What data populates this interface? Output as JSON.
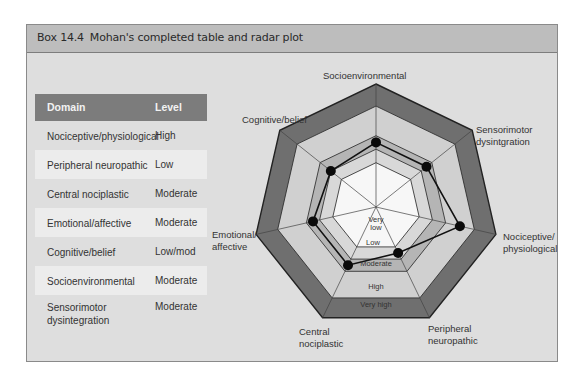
{
  "box": {
    "number": "Box 14.4",
    "title": "Mohan's completed table and radar plot"
  },
  "table": {
    "headers": [
      "Domain",
      "Level"
    ],
    "rows": [
      {
        "domain": "Nociceptive/physiological",
        "level": "High"
      },
      {
        "domain": "Peripheral neuropathic",
        "level": "Low"
      },
      {
        "domain": "Central nociplastic",
        "level": "Moderate"
      },
      {
        "domain": "Emotional/affective",
        "level": "Moderate"
      },
      {
        "domain": "Cognitive/belief",
        "level": "Low/mod"
      },
      {
        "domain": "Socioenvironmental",
        "level": "Moderate"
      },
      {
        "domain": "Sensorimotor dysintegration",
        "level": "Moderate"
      }
    ]
  },
  "radar": {
    "axis_labels": {
      "socio": "Socioenvironmental",
      "sensori_1": "Sensorimotor",
      "sensori_2": "dysintgration",
      "noci_1": "Nociceptive/",
      "noci_2": "physiological",
      "periph_1": "Peripheral",
      "periph_2": "neuropathic",
      "central_1": "Central",
      "central_2": "nociplastic",
      "emotional_1": "Emotional/",
      "emotional_2": "affective",
      "cognitive": "Cognitive/belief"
    },
    "band_labels": {
      "very_low_1": "Very",
      "very_low_2": "low",
      "low": "Low",
      "moderate": "Moderate",
      "high": "High",
      "very_high": "Very high"
    }
  },
  "chart_data": {
    "type": "radar",
    "title": "Mohan's completed table and radar plot",
    "axes": [
      "Socioenvironmental",
      "Sensorimotor dysintgration",
      "Nociceptive/physiological",
      "Peripheral neuropathic",
      "Central nociplastic",
      "Emotional/affective",
      "Cognitive/belief"
    ],
    "scale": [
      "Very low",
      "Low",
      "Moderate",
      "High",
      "Very high"
    ],
    "values": [
      3,
      3,
      4,
      2,
      3,
      3,
      2.5
    ],
    "value_labels": [
      "Moderate",
      "Moderate",
      "High",
      "Low",
      "Moderate",
      "Moderate",
      "Low/mod"
    ],
    "band_colors": [
      "#f7f7f7",
      "#d8d8d8",
      "#b5b5b5",
      "#d0d0d0",
      "#6f6f6f"
    ]
  }
}
